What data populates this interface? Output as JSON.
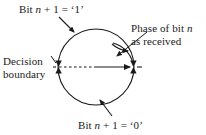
{
  "figure": {
    "background_color": "#ffffff",
    "stroke_color": "#1a1a1a",
    "text_color": "#1a1a1a"
  },
  "labels": {
    "bit_one": {
      "prefix": "Bit ",
      "variable": "n",
      "suffix": " + 1 = ‘1’",
      "full_text": "Bit n + 1 = ‘1’"
    },
    "bit_zero": {
      "prefix": "Bit ",
      "variable": "n",
      "suffix": " + 1 = ‘0’",
      "full_text": "Bit n + 1 = ‘0’"
    },
    "phase": {
      "line1_prefix": "Phase of bit ",
      "line1_variable": "n",
      "line2": "as received",
      "full_text": "Phase of bit n as received"
    },
    "decision_boundary": {
      "line1": "Decision",
      "line2": "boundary",
      "full_text": "Decision boundary"
    }
  },
  "geometry": {
    "circle": {
      "center_x": 96,
      "center_y": 67,
      "radius": 38
    },
    "decision_boundary_line": {
      "style": "dashed",
      "from_x": 58,
      "to_x": 96,
      "y": 67
    },
    "phase_vector": {
      "style": "solid-arrow",
      "from_x": 96,
      "from_y": 67,
      "to_x": 133,
      "to_y": 67,
      "angle_degrees": 0
    },
    "phase_arc": {
      "style": "curved-arrow",
      "start_angle_degrees": -52,
      "end_angle_degrees": 0,
      "radius": 27
    },
    "boundary_markers": [
      {
        "position": "left",
        "x": 58,
        "y": 67,
        "type": "double-arrowhead"
      },
      {
        "position": "right",
        "x": 134,
        "y": 67,
        "type": "double-arrowhead"
      }
    ],
    "leader_lines": [
      {
        "name": "bit-one",
        "from_x": 59,
        "from_y": 17,
        "to_x": 76,
        "to_y": 34
      },
      {
        "name": "phase",
        "from_x": 146,
        "from_y": 33,
        "to_x": 116,
        "to_y": 57
      },
      {
        "name": "decision",
        "from_x": 52,
        "from_y": 57,
        "to_x": 57,
        "to_y": 66
      },
      {
        "name": "bit-zero",
        "from_x": 111,
        "from_y": 115,
        "to_x": 101,
        "to_y": 101
      }
    ]
  }
}
